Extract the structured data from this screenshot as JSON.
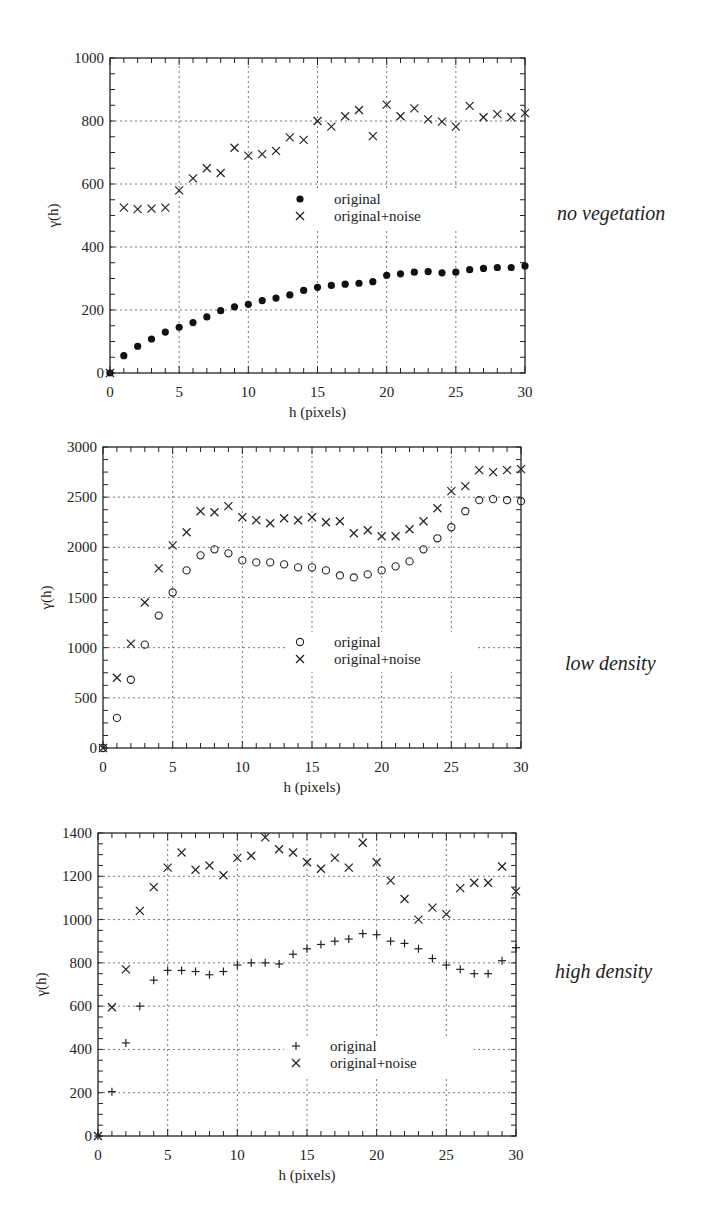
{
  "chart_data": [
    {
      "type": "scatter",
      "title": "",
      "panel_label": "no vegetation",
      "xlabel": "h (pixels)",
      "ylabel": "γ(h)",
      "xlim": [
        0,
        30
      ],
      "ylim": [
        0,
        1000
      ],
      "xticks": [
        0,
        5,
        10,
        15,
        20,
        25,
        30
      ],
      "yticks": [
        0,
        200,
        400,
        600,
        800,
        1000
      ],
      "grid": true,
      "legend_position": "center-right",
      "x": [
        0,
        1,
        2,
        3,
        4,
        5,
        6,
        7,
        8,
        9,
        10,
        11,
        12,
        13,
        14,
        15,
        16,
        17,
        18,
        19,
        20,
        21,
        22,
        23,
        24,
        25,
        26,
        27,
        28,
        29,
        30
      ],
      "series": [
        {
          "name": "original",
          "marker": "filled-circle",
          "values": [
            0,
            55,
            85,
            108,
            130,
            145,
            160,
            178,
            198,
            210,
            218,
            230,
            238,
            248,
            262,
            272,
            278,
            282,
            285,
            290,
            310,
            315,
            320,
            322,
            318,
            320,
            328,
            332,
            335,
            335,
            340
          ]
        },
        {
          "name": "original+noise",
          "marker": "x",
          "values": [
            0,
            525,
            520,
            522,
            525,
            580,
            618,
            650,
            635,
            715,
            690,
            695,
            705,
            748,
            740,
            800,
            782,
            815,
            835,
            752,
            852,
            815,
            840,
            805,
            798,
            782,
            848,
            812,
            822,
            812,
            825
          ]
        }
      ]
    },
    {
      "type": "scatter",
      "title": "",
      "panel_label": "low density",
      "xlabel": "h (pixels)",
      "ylabel": "γ(h)",
      "xlim": [
        0,
        30
      ],
      "ylim": [
        0,
        3000
      ],
      "xticks": [
        0,
        5,
        10,
        15,
        20,
        25,
        30
      ],
      "yticks": [
        0,
        500,
        1000,
        1500,
        2000,
        2500,
        3000
      ],
      "grid": true,
      "legend_position": "center-right",
      "x": [
        0,
        1,
        2,
        3,
        4,
        5,
        6,
        7,
        8,
        9,
        10,
        11,
        12,
        13,
        14,
        15,
        16,
        17,
        18,
        19,
        20,
        21,
        22,
        23,
        24,
        25,
        26,
        27,
        28,
        29,
        30
      ],
      "series": [
        {
          "name": "original",
          "marker": "open-circle",
          "values": [
            0,
            300,
            680,
            1030,
            1320,
            1550,
            1770,
            1920,
            1980,
            1940,
            1870,
            1850,
            1850,
            1830,
            1800,
            1800,
            1770,
            1720,
            1700,
            1730,
            1770,
            1810,
            1860,
            1980,
            2090,
            2200,
            2360,
            2470,
            2480,
            2470,
            2460
          ]
        },
        {
          "name": "original+noise",
          "marker": "x",
          "values": [
            0,
            700,
            1040,
            1450,
            1790,
            2020,
            2150,
            2360,
            2350,
            2410,
            2300,
            2270,
            2240,
            2290,
            2270,
            2300,
            2250,
            2260,
            2140,
            2170,
            2110,
            2110,
            2180,
            2260,
            2390,
            2560,
            2610,
            2770,
            2750,
            2770,
            2780
          ]
        }
      ]
    },
    {
      "type": "scatter",
      "title": "",
      "panel_label": "high density",
      "xlabel": "h (pixels)",
      "ylabel": "γ(h)",
      "xlim": [
        0,
        30
      ],
      "ylim": [
        0,
        1400
      ],
      "xticks": [
        0,
        5,
        10,
        15,
        20,
        25,
        30
      ],
      "yticks": [
        0,
        200,
        400,
        600,
        800,
        1000,
        1200,
        1400
      ],
      "grid": true,
      "legend_position": "center-right",
      "x": [
        0,
        1,
        2,
        3,
        4,
        5,
        6,
        7,
        8,
        9,
        10,
        11,
        12,
        13,
        14,
        15,
        16,
        17,
        18,
        19,
        20,
        21,
        22,
        23,
        24,
        25,
        26,
        27,
        28,
        29,
        30
      ],
      "series": [
        {
          "name": "original",
          "marker": "plus",
          "values": [
            0,
            205,
            430,
            600,
            720,
            765,
            765,
            760,
            745,
            760,
            790,
            800,
            800,
            795,
            840,
            865,
            885,
            900,
            910,
            935,
            930,
            900,
            890,
            865,
            820,
            790,
            770,
            750,
            750,
            810,
            870
          ]
        },
        {
          "name": "original+noise",
          "marker": "x",
          "values": [
            0,
            595,
            770,
            1040,
            1150,
            1240,
            1310,
            1230,
            1250,
            1205,
            1285,
            1295,
            1380,
            1325,
            1310,
            1265,
            1235,
            1285,
            1240,
            1355,
            1265,
            1180,
            1095,
            1000,
            1055,
            1025,
            1145,
            1170,
            1170,
            1245,
            1130
          ]
        }
      ]
    }
  ],
  "labels": {
    "panel1": "no vegetation",
    "panel2": "low density",
    "panel3": "high density"
  }
}
